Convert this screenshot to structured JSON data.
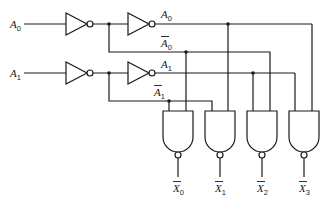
{
  "diagram": {
    "inputs": [
      {
        "name": "A",
        "sub": "0"
      },
      {
        "name": "A",
        "sub": "1"
      }
    ],
    "signals": {
      "a0": {
        "name": "A",
        "sub": "0"
      },
      "a0_bar": {
        "name": "A",
        "sub": "0"
      },
      "a1": {
        "name": "A",
        "sub": "1"
      },
      "a1_bar": {
        "name": "A",
        "sub": "1"
      }
    },
    "outputs": [
      {
        "name": "X",
        "sub": "0"
      },
      {
        "name": "X",
        "sub": "1"
      },
      {
        "name": "X",
        "sub": "2"
      },
      {
        "name": "X",
        "sub": "3"
      }
    ],
    "gates": {
      "inverters": 4,
      "nand_gates": 4
    },
    "colors": {
      "line": "#1a1a1a",
      "background": "#ffffff"
    }
  }
}
